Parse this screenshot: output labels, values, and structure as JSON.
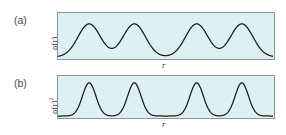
{
  "figure": {
    "background_color": "#ffffff",
    "panel_fill_color": "#ddf0f2",
    "panel_border_color": "#8a9499",
    "curve_color": "#1a1a1a"
  },
  "panels": [
    {
      "tag": "(a)",
      "ylabel_base": "ρ(r)",
      "ylabel_exponent": "",
      "xlabel": "r"
    },
    {
      "tag": "(b)",
      "ylabel_base": "ρ(r)",
      "ylabel_exponent": "2",
      "xlabel": "r"
    }
  ],
  "chart_data": [
    {
      "type": "line",
      "title": "(a)",
      "xlabel": "r",
      "ylabel": "ρ(r)",
      "grid": false,
      "legend": "none",
      "xlim": [
        0,
        1
      ],
      "ylim": [
        0,
        1
      ],
      "peak_shape": "broad gaussian",
      "peak_centers": [
        0.145,
        0.355,
        0.645,
        0.855
      ],
      "peak_heights": [
        0.78,
        0.78,
        0.78,
        0.78
      ],
      "peak_widths": [
        0.052,
        0.052,
        0.052,
        0.052
      ],
      "baseline": 0.0,
      "note": "four broad equal-height density peaks with a wider gap at the center"
    },
    {
      "type": "line",
      "title": "(b)",
      "xlabel": "r",
      "ylabel": "ρ(r)²",
      "grid": false,
      "legend": "none",
      "xlim": [
        0,
        1
      ],
      "ylim": [
        0,
        1
      ],
      "peak_shape": "narrow gaussian",
      "peak_centers": [
        0.145,
        0.355,
        0.645,
        0.855
      ],
      "peak_heights": [
        0.86,
        0.86,
        0.86,
        0.86
      ],
      "peak_widths": [
        0.031,
        0.031,
        0.031,
        0.031
      ],
      "baseline": 0.0,
      "note": "same four peak positions, squared density gives narrower sharper peaks"
    }
  ]
}
